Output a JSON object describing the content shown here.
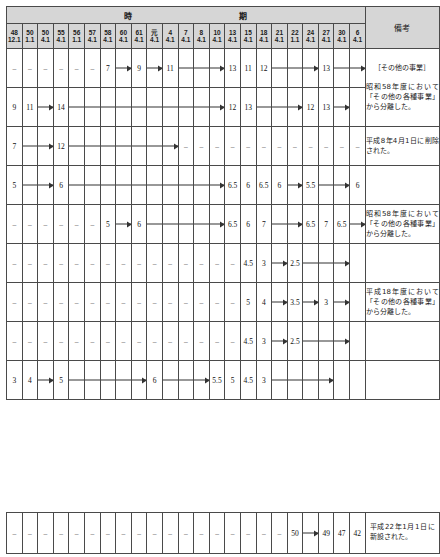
{
  "header": {
    "period_group_label_1": "時",
    "period_group_label_2": "期",
    "remarks_label": "備考",
    "period_columns": [
      {
        "era_year": "48",
        "date": "12.1"
      },
      {
        "era_year": "50",
        "date": "1.1"
      },
      {
        "era_year": "50",
        "date": "4.1"
      },
      {
        "era_year": "55",
        "date": "4.1"
      },
      {
        "era_year": "56",
        "date": "1.1"
      },
      {
        "era_year": "57",
        "date": "4.1"
      },
      {
        "era_year": "58",
        "date": "4.1"
      },
      {
        "era_year": "60",
        "date": "4.1"
      },
      {
        "era_year": "61",
        "date": "4.1"
      },
      {
        "era_year": "元",
        "date": "4.1"
      },
      {
        "era_year": "4",
        "date": "4.1"
      },
      {
        "era_year": "7",
        "date": "4.1"
      },
      {
        "era_year": "8",
        "date": "4.1"
      },
      {
        "era_year": "10",
        "date": "4.1"
      },
      {
        "era_year": "13",
        "date": "4.1"
      },
      {
        "era_year": "15",
        "date": "4.1"
      },
      {
        "era_year": "18",
        "date": "4.1"
      },
      {
        "era_year": "21",
        "date": "4.1"
      },
      {
        "era_year": "22",
        "date": "1.1"
      },
      {
        "era_year": "24",
        "date": "4.1"
      },
      {
        "era_year": "27",
        "date": "4.1"
      },
      {
        "era_year": "30",
        "date": "4.1"
      },
      {
        "era_year": "6",
        "date": "4.1"
      }
    ]
  },
  "rows": [
    {
      "cells": [
        {
          "text": "–",
          "kind": "dash"
        },
        {
          "text": "–",
          "kind": "dash"
        },
        {
          "text": "–",
          "kind": "dash"
        },
        {
          "text": "–",
          "kind": "dash"
        },
        {
          "text": "–",
          "kind": "dash"
        },
        {
          "text": "–",
          "kind": "dash"
        },
        {
          "text": "7",
          "kind": "val"
        },
        {
          "text": "",
          "kind": "arrow-head"
        },
        {
          "text": "9",
          "kind": "val"
        },
        {
          "text": "",
          "kind": "arrow-head"
        },
        {
          "text": "11",
          "kind": "val"
        },
        {
          "text": "",
          "kind": "arrow-line"
        },
        {
          "text": "",
          "kind": "arrow-line"
        },
        {
          "text": "",
          "kind": "arrow-head"
        },
        {
          "text": "13",
          "kind": "val"
        },
        {
          "text": "11",
          "kind": "val"
        },
        {
          "text": "12",
          "kind": "val"
        },
        {
          "text": "",
          "kind": "arrow-line"
        },
        {
          "text": "",
          "kind": "arrow-line"
        },
        {
          "text": "",
          "kind": "arrow-head"
        },
        {
          "text": "13",
          "kind": "val"
        },
        {
          "text": "",
          "kind": "arrow-line"
        },
        {
          "text": "",
          "kind": "arrow-head"
        }
      ],
      "remark": {
        "title": "［その他の事業］",
        "body": "昭和58年度において「その他の各種事業」から分離した。",
        "rowspan": 2
      }
    },
    {
      "cells": [
        {
          "text": "9",
          "kind": "val"
        },
        {
          "text": "11",
          "kind": "val"
        },
        {
          "text": "",
          "kind": "arrow-head"
        },
        {
          "text": "14",
          "kind": "val"
        },
        {
          "text": "",
          "kind": "arrow-line"
        },
        {
          "text": "",
          "kind": "arrow-line"
        },
        {
          "text": "",
          "kind": "arrow-line"
        },
        {
          "text": "",
          "kind": "arrow-line"
        },
        {
          "text": "",
          "kind": "arrow-line"
        },
        {
          "text": "",
          "kind": "arrow-line"
        },
        {
          "text": "",
          "kind": "arrow-line"
        },
        {
          "text": "",
          "kind": "arrow-line"
        },
        {
          "text": "",
          "kind": "arrow-line"
        },
        {
          "text": "",
          "kind": "arrow-head"
        },
        {
          "text": "12",
          "kind": "val"
        },
        {
          "text": "13",
          "kind": "val"
        },
        {
          "text": "",
          "kind": "arrow-line"
        },
        {
          "text": "",
          "kind": "arrow-line"
        },
        {
          "text": "",
          "kind": "arrow-head"
        },
        {
          "text": "12",
          "kind": "val"
        },
        {
          "text": "13",
          "kind": "val"
        },
        {
          "text": "",
          "kind": "arrow-head"
        },
        {
          "text": "",
          "kind": "empty"
        }
      ],
      "remark": null
    },
    {
      "cells": [
        {
          "text": "7",
          "kind": "val"
        },
        {
          "text": "",
          "kind": "arrow-line"
        },
        {
          "text": "",
          "kind": "arrow-head"
        },
        {
          "text": "12",
          "kind": "val"
        },
        {
          "text": "",
          "kind": "arrow-line"
        },
        {
          "text": "",
          "kind": "arrow-line"
        },
        {
          "text": "",
          "kind": "arrow-line"
        },
        {
          "text": "",
          "kind": "arrow-line"
        },
        {
          "text": "",
          "kind": "arrow-line"
        },
        {
          "text": "",
          "kind": "arrow-line"
        },
        {
          "text": "",
          "kind": "arrow-head"
        },
        {
          "text": "–",
          "kind": "dash"
        },
        {
          "text": "–",
          "kind": "dash"
        },
        {
          "text": "–",
          "kind": "dash"
        },
        {
          "text": "–",
          "kind": "dash"
        },
        {
          "text": "–",
          "kind": "dash"
        },
        {
          "text": "–",
          "kind": "dash"
        },
        {
          "text": "–",
          "kind": "dash"
        },
        {
          "text": "–",
          "kind": "dash"
        },
        {
          "text": "–",
          "kind": "dash"
        },
        {
          "text": "–",
          "kind": "dash"
        },
        {
          "text": "–",
          "kind": "dash"
        },
        {
          "text": "–",
          "kind": "dash"
        }
      ],
      "remark": {
        "title": "",
        "body": "平成8年4月1日に削除された。",
        "rowspan": 1
      }
    },
    {
      "cells": [
        {
          "text": "5",
          "kind": "val"
        },
        {
          "text": "",
          "kind": "arrow-line"
        },
        {
          "text": "",
          "kind": "arrow-head"
        },
        {
          "text": "6",
          "kind": "val"
        },
        {
          "text": "",
          "kind": "arrow-line"
        },
        {
          "text": "",
          "kind": "arrow-line"
        },
        {
          "text": "",
          "kind": "arrow-line"
        },
        {
          "text": "",
          "kind": "arrow-line"
        },
        {
          "text": "",
          "kind": "arrow-line"
        },
        {
          "text": "",
          "kind": "arrow-line"
        },
        {
          "text": "",
          "kind": "arrow-line"
        },
        {
          "text": "",
          "kind": "arrow-line"
        },
        {
          "text": "",
          "kind": "arrow-line"
        },
        {
          "text": "",
          "kind": "arrow-head"
        },
        {
          "text": "6.5",
          "kind": "val"
        },
        {
          "text": "6",
          "kind": "val"
        },
        {
          "text": "6.5",
          "kind": "val"
        },
        {
          "text": "6",
          "kind": "val"
        },
        {
          "text": "",
          "kind": "arrow-head"
        },
        {
          "text": "5.5",
          "kind": "val"
        },
        {
          "text": "",
          "kind": "arrow-line"
        },
        {
          "text": "",
          "kind": "arrow-head"
        },
        {
          "text": "6",
          "kind": "val"
        }
      ],
      "remark": {
        "title": "",
        "body": "",
        "rowspan": 1
      }
    },
    {
      "cells": [
        {
          "text": "–",
          "kind": "dash"
        },
        {
          "text": "–",
          "kind": "dash"
        },
        {
          "text": "–",
          "kind": "dash"
        },
        {
          "text": "–",
          "kind": "dash"
        },
        {
          "text": "–",
          "kind": "dash"
        },
        {
          "text": "–",
          "kind": "dash"
        },
        {
          "text": "5",
          "kind": "val"
        },
        {
          "text": "",
          "kind": "arrow-head"
        },
        {
          "text": "6",
          "kind": "val"
        },
        {
          "text": "",
          "kind": "arrow-line"
        },
        {
          "text": "",
          "kind": "arrow-line"
        },
        {
          "text": "",
          "kind": "arrow-line"
        },
        {
          "text": "",
          "kind": "arrow-line"
        },
        {
          "text": "",
          "kind": "arrow-head"
        },
        {
          "text": "6.5",
          "kind": "val"
        },
        {
          "text": "6",
          "kind": "val"
        },
        {
          "text": "7",
          "kind": "val"
        },
        {
          "text": "",
          "kind": "arrow-line"
        },
        {
          "text": "",
          "kind": "arrow-head"
        },
        {
          "text": "6.5",
          "kind": "val"
        },
        {
          "text": "7",
          "kind": "val"
        },
        {
          "text": "6.5",
          "kind": "val"
        },
        {
          "text": "",
          "kind": "arrow-head"
        }
      ],
      "remark": {
        "title": "",
        "body": "昭和58年度において「その他の各種事業」から分離した。",
        "rowspan": 1
      }
    },
    {
      "cells": [
        {
          "text": "–",
          "kind": "dash"
        },
        {
          "text": "–",
          "kind": "dash"
        },
        {
          "text": "–",
          "kind": "dash"
        },
        {
          "text": "–",
          "kind": "dash"
        },
        {
          "text": "–",
          "kind": "dash"
        },
        {
          "text": "–",
          "kind": "dash"
        },
        {
          "text": "–",
          "kind": "dash"
        },
        {
          "text": "–",
          "kind": "dash"
        },
        {
          "text": "–",
          "kind": "dash"
        },
        {
          "text": "–",
          "kind": "dash"
        },
        {
          "text": "–",
          "kind": "dash"
        },
        {
          "text": "–",
          "kind": "dash"
        },
        {
          "text": "–",
          "kind": "dash"
        },
        {
          "text": "–",
          "kind": "dash"
        },
        {
          "text": "–",
          "kind": "dash"
        },
        {
          "text": "4.5",
          "kind": "val"
        },
        {
          "text": "3",
          "kind": "val"
        },
        {
          "text": "",
          "kind": "arrow-head"
        },
        {
          "text": "2.5",
          "kind": "val"
        },
        {
          "text": "",
          "kind": "arrow-line"
        },
        {
          "text": "",
          "kind": "arrow-line"
        },
        {
          "text": "",
          "kind": "arrow-head"
        },
        {
          "text": "",
          "kind": "empty"
        }
      ],
      "remark": {
        "title": "",
        "body": "",
        "rowspan": 1
      }
    },
    {
      "cells": [
        {
          "text": "–",
          "kind": "dash"
        },
        {
          "text": "–",
          "kind": "dash"
        },
        {
          "text": "–",
          "kind": "dash"
        },
        {
          "text": "–",
          "kind": "dash"
        },
        {
          "text": "–",
          "kind": "dash"
        },
        {
          "text": "–",
          "kind": "dash"
        },
        {
          "text": "–",
          "kind": "dash"
        },
        {
          "text": "–",
          "kind": "dash"
        },
        {
          "text": "–",
          "kind": "dash"
        },
        {
          "text": "–",
          "kind": "dash"
        },
        {
          "text": "–",
          "kind": "dash"
        },
        {
          "text": "–",
          "kind": "dash"
        },
        {
          "text": "–",
          "kind": "dash"
        },
        {
          "text": "–",
          "kind": "dash"
        },
        {
          "text": "–",
          "kind": "dash"
        },
        {
          "text": "5",
          "kind": "val"
        },
        {
          "text": "4",
          "kind": "val"
        },
        {
          "text": "",
          "kind": "arrow-head"
        },
        {
          "text": "3.5",
          "kind": "val"
        },
        {
          "text": "",
          "kind": "arrow-head"
        },
        {
          "text": "3",
          "kind": "val"
        },
        {
          "text": "",
          "kind": "arrow-head"
        },
        {
          "text": "",
          "kind": "empty"
        }
      ],
      "remark": {
        "title": "",
        "body": "平成18年度において「その他の各種事業」から分離した。",
        "rowspan": 1
      }
    },
    {
      "cells": [
        {
          "text": "–",
          "kind": "dash"
        },
        {
          "text": "–",
          "kind": "dash"
        },
        {
          "text": "–",
          "kind": "dash"
        },
        {
          "text": "–",
          "kind": "dash"
        },
        {
          "text": "–",
          "kind": "dash"
        },
        {
          "text": "–",
          "kind": "dash"
        },
        {
          "text": "–",
          "kind": "dash"
        },
        {
          "text": "–",
          "kind": "dash"
        },
        {
          "text": "–",
          "kind": "dash"
        },
        {
          "text": "–",
          "kind": "dash"
        },
        {
          "text": "–",
          "kind": "dash"
        },
        {
          "text": "–",
          "kind": "dash"
        },
        {
          "text": "–",
          "kind": "dash"
        },
        {
          "text": "–",
          "kind": "dash"
        },
        {
          "text": "–",
          "kind": "dash"
        },
        {
          "text": "4.5",
          "kind": "val"
        },
        {
          "text": "3",
          "kind": "val"
        },
        {
          "text": "",
          "kind": "arrow-head"
        },
        {
          "text": "2.5",
          "kind": "val"
        },
        {
          "text": "",
          "kind": "arrow-line"
        },
        {
          "text": "",
          "kind": "arrow-line"
        },
        {
          "text": "",
          "kind": "arrow-head"
        },
        {
          "text": "",
          "kind": "empty"
        }
      ],
      "remark": {
        "title": "",
        "body": "",
        "rowspan": 1
      }
    },
    {
      "cells": [
        {
          "text": "3",
          "kind": "val"
        },
        {
          "text": "4",
          "kind": "val"
        },
        {
          "text": "",
          "kind": "arrow-head"
        },
        {
          "text": "5",
          "kind": "val"
        },
        {
          "text": "",
          "kind": "arrow-line"
        },
        {
          "text": "",
          "kind": "arrow-line"
        },
        {
          "text": "",
          "kind": "arrow-line"
        },
        {
          "text": "",
          "kind": "arrow-line"
        },
        {
          "text": "",
          "kind": "arrow-head"
        },
        {
          "text": "6",
          "kind": "val"
        },
        {
          "text": "",
          "kind": "arrow-line"
        },
        {
          "text": "",
          "kind": "arrow-line"
        },
        {
          "text": "",
          "kind": "arrow-head"
        },
        {
          "text": "5.5",
          "kind": "val"
        },
        {
          "text": "5",
          "kind": "val"
        },
        {
          "text": "4.5",
          "kind": "val"
        },
        {
          "text": "3",
          "kind": "val"
        },
        {
          "text": "",
          "kind": "arrow-line"
        },
        {
          "text": "",
          "kind": "arrow-line"
        },
        {
          "text": "",
          "kind": "arrow-line"
        },
        {
          "text": "",
          "kind": "arrow-head"
        },
        {
          "text": "",
          "kind": "empty"
        },
        {
          "text": "",
          "kind": "empty"
        }
      ],
      "remark": {
        "title": "",
        "body": "",
        "rowspan": 1
      }
    }
  ],
  "bottom_rows": [
    {
      "cells": [
        {
          "text": "–",
          "kind": "dash"
        },
        {
          "text": "–",
          "kind": "dash"
        },
        {
          "text": "–",
          "kind": "dash"
        },
        {
          "text": "–",
          "kind": "dash"
        },
        {
          "text": "–",
          "kind": "dash"
        },
        {
          "text": "–",
          "kind": "dash"
        },
        {
          "text": "–",
          "kind": "dash"
        },
        {
          "text": "–",
          "kind": "dash"
        },
        {
          "text": "–",
          "kind": "dash"
        },
        {
          "text": "–",
          "kind": "dash"
        },
        {
          "text": "–",
          "kind": "dash"
        },
        {
          "text": "–",
          "kind": "dash"
        },
        {
          "text": "–",
          "kind": "dash"
        },
        {
          "text": "–",
          "kind": "dash"
        },
        {
          "text": "–",
          "kind": "dash"
        },
        {
          "text": "–",
          "kind": "dash"
        },
        {
          "text": "–",
          "kind": "dash"
        },
        {
          "text": "–",
          "kind": "dash"
        },
        {
          "text": "50",
          "kind": "val"
        },
        {
          "text": "",
          "kind": "arrow-head"
        },
        {
          "text": "49",
          "kind": "val"
        },
        {
          "text": "47",
          "kind": "val"
        },
        {
          "text": "42",
          "kind": "val"
        }
      ],
      "remark": {
        "title": "",
        "body": "平成22年1月1日に新設された。",
        "rowspan": 1
      }
    }
  ]
}
